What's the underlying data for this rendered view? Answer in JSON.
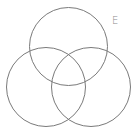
{
  "diagram": {
    "type": "venn",
    "background": "#ffffff",
    "stroke_color": "#7a7a7a",
    "label_color": "#8a8a8a",
    "label": {
      "text": "E",
      "x": 112,
      "y": 16
    },
    "circles": [
      {
        "name": "top",
        "cx": 68.5,
        "cy": 46.5,
        "r": 39
      },
      {
        "name": "left",
        "cx": 46,
        "cy": 87,
        "r": 39.5
      },
      {
        "name": "right",
        "cx": 91,
        "cy": 87,
        "r": 39.5
      }
    ]
  }
}
